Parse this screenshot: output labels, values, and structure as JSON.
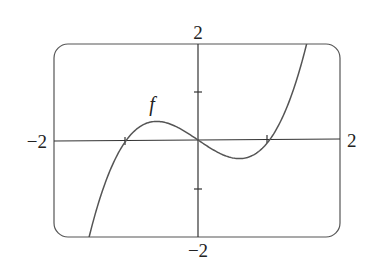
{
  "chart_data": {
    "type": "line",
    "title": "",
    "xlabel": "",
    "ylabel": "",
    "xlim": [
      -2,
      2
    ],
    "ylim": [
      -2,
      2
    ],
    "grid": false,
    "legend": null,
    "tick_labels": {
      "x_min": "−2",
      "x_max": "2",
      "y_min": "−2",
      "y_max": "2"
    },
    "x_ticks": [
      -1,
      1
    ],
    "y_ticks": [
      -1,
      1
    ],
    "series": [
      {
        "name": "f",
        "expression": "x^3 - x",
        "x": [
          -1.65,
          -1.5,
          -1.25,
          -1.0,
          -0.75,
          -0.577,
          -0.5,
          -0.25,
          0.0,
          0.25,
          0.5,
          0.577,
          0.75,
          1.0,
          1.25,
          1.5,
          1.75,
          1.82
        ],
        "values": [
          -2.84,
          -1.875,
          -0.703,
          0.0,
          0.328,
          0.385,
          0.375,
          0.234,
          0.0,
          -0.234,
          -0.375,
          -0.385,
          -0.328,
          0.0,
          0.703,
          1.875,
          3.61,
          4.21
        ]
      }
    ],
    "annotations": [
      {
        "text": "f",
        "x": -0.72,
        "y": 0.95
      }
    ]
  }
}
